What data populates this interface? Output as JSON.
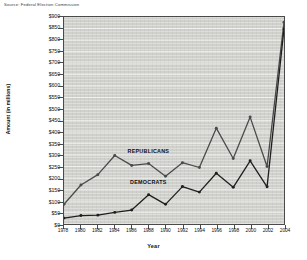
{
  "source_note": "Source: Federal Election Commission",
  "chart_data": {
    "type": "line",
    "title": "",
    "xlabel": "Year",
    "ylabel": "Amount (in millions)",
    "x": [
      1978,
      1980,
      1982,
      1984,
      1986,
      1988,
      1990,
      1992,
      1994,
      1996,
      1998,
      2000,
      2002,
      2004
    ],
    "categories": [
      "1978",
      "1980",
      "1982",
      "1984",
      "1986",
      "1988",
      "1990",
      "1992",
      "1994",
      "1996",
      "1998",
      "2000",
      "2002",
      "2004"
    ],
    "xlim": [
      1978,
      2004
    ],
    "ylim": [
      0,
      900
    ],
    "ytick_labels": [
      "$900",
      "$850",
      "$800",
      "$750",
      "$700",
      "$650",
      "$600",
      "$550",
      "$500",
      "$450",
      "$400",
      "$350",
      "$300",
      "$250",
      "$200",
      "$150",
      "$100",
      "$50",
      "$0"
    ],
    "ytick_values": [
      900,
      850,
      800,
      750,
      700,
      650,
      600,
      550,
      500,
      450,
      400,
      350,
      300,
      250,
      200,
      150,
      100,
      50,
      0
    ],
    "ytick_step": 50,
    "grid": true,
    "legend_position": "inline-annotation",
    "series": [
      {
        "name": "REPUBLICANS",
        "color": "#4a4a4a",
        "values": [
          86,
          170,
          215,
          298,
          255,
          263,
          208,
          267,
          246,
          417,
          285,
          465,
          250,
          877
        ],
        "label_x": 1988,
        "label_y": 315
      },
      {
        "name": "DEMOCRATS",
        "color": "#1e1e1e",
        "values": [
          26,
          37,
          39,
          51,
          61,
          128,
          86,
          163,
          139,
          221,
          160,
          275,
          162,
          848
        ],
        "label_x": 1988,
        "label_y": 185
      }
    ]
  }
}
